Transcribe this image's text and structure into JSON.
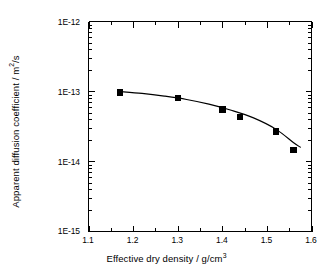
{
  "chart_data": {
    "type": "scatter",
    "title": "",
    "subtitle": "",
    "xlabel_parts": {
      "text": "Effective dry density / g/cm",
      "sup": "3"
    },
    "ylabel_parts": {
      "pre": "Apparent diffusion coefficient / m",
      "sup": "2",
      "post": "/s"
    },
    "xlabel": "Effective dry density / g/cm3",
    "ylabel": "Apparent diffusion coefficient / m2/s",
    "x_scale": "linear",
    "y_scale": "log",
    "xlim": [
      1.1,
      1.6
    ],
    "ylim": [
      1e-15,
      1e-12
    ],
    "grid": false,
    "legend": "none",
    "x_ticks": [
      1.1,
      1.2,
      1.3,
      1.4,
      1.5,
      1.6
    ],
    "x_tick_labels": [
      "1.1",
      "1.2",
      "1.3",
      "1.4",
      "1.5",
      "1.6"
    ],
    "x_minor_ticks_per_interval": 1,
    "y_ticks": [
      1e-15,
      1e-14,
      1e-13,
      1e-12
    ],
    "y_tick_labels": [
      "1E-15",
      "1E-14",
      "1E-13",
      "1E-12"
    ],
    "y_minor_ticks": "log-decade-2-to-9",
    "marker": "filled-square",
    "marker_color": "#000000",
    "line_color": "#000000",
    "axis_color": "#000000",
    "background_color": "#ffffff",
    "x": [
      1.17,
      1.3,
      1.4,
      1.44,
      1.52,
      1.56
    ],
    "y": [
      9.7e-14,
      8e-14,
      5.5e-14,
      4.3e-14,
      2.7e-14,
      1.45e-14
    ],
    "points": [
      {
        "x": 1.17,
        "y": 9.7e-14
      },
      {
        "x": 1.3,
        "y": 8e-14
      },
      {
        "x": 1.4,
        "y": 5.5e-14
      },
      {
        "x": 1.44,
        "y": 4.3e-14
      },
      {
        "x": 1.52,
        "y": 2.7e-14
      },
      {
        "x": 1.56,
        "y": 1.45e-14
      }
    ],
    "fit_curve": {
      "name": "fitted trend line",
      "x": [
        1.17,
        1.22,
        1.27,
        1.32,
        1.37,
        1.42,
        1.47,
        1.52,
        1.56,
        1.575
      ],
      "y": [
        1e-13,
        9.4e-14,
        8.6e-14,
        7.7e-14,
        6.6e-14,
        5.4e-14,
        4.2e-14,
        2.9e-14,
        1.85e-14,
        1.6e-14
      ]
    }
  },
  "axes": {
    "y_tick_labels": [
      "1E-12",
      "1E-13",
      "1E-14",
      "1E-15"
    ],
    "x_tick_labels": [
      "1.1",
      "1.2",
      "1.3",
      "1.4",
      "1.5",
      "1.6"
    ]
  },
  "labels": {
    "x_title_text": "Effective dry density / g/cm",
    "x_title_sup": "3",
    "y_title_pre": "Apparent diffusion coefficient / m",
    "y_title_sup": "2",
    "y_title_post": "/s"
  }
}
